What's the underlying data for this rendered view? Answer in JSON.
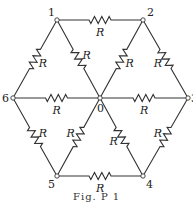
{
  "figure": {
    "caption": "Fig. P 1",
    "resistor_label": "R",
    "nodes": [
      {
        "id": "0",
        "x": 100,
        "y": 98
      },
      {
        "id": "1",
        "x": 57,
        "y": 20
      },
      {
        "id": "2",
        "x": 143,
        "y": 20
      },
      {
        "id": "3",
        "x": 188,
        "y": 98
      },
      {
        "id": "4",
        "x": 143,
        "y": 176
      },
      {
        "id": "5",
        "x": 57,
        "y": 176
      },
      {
        "id": "6",
        "x": 13,
        "y": 98
      }
    ],
    "edges": [
      [
        "1",
        "2"
      ],
      [
        "2",
        "3"
      ],
      [
        "3",
        "4"
      ],
      [
        "4",
        "5"
      ],
      [
        "5",
        "6"
      ],
      [
        "6",
        "1"
      ],
      [
        "0",
        "1"
      ],
      [
        "0",
        "2"
      ],
      [
        "0",
        "3"
      ],
      [
        "0",
        "4"
      ],
      [
        "0",
        "5"
      ],
      [
        "0",
        "6"
      ]
    ]
  }
}
